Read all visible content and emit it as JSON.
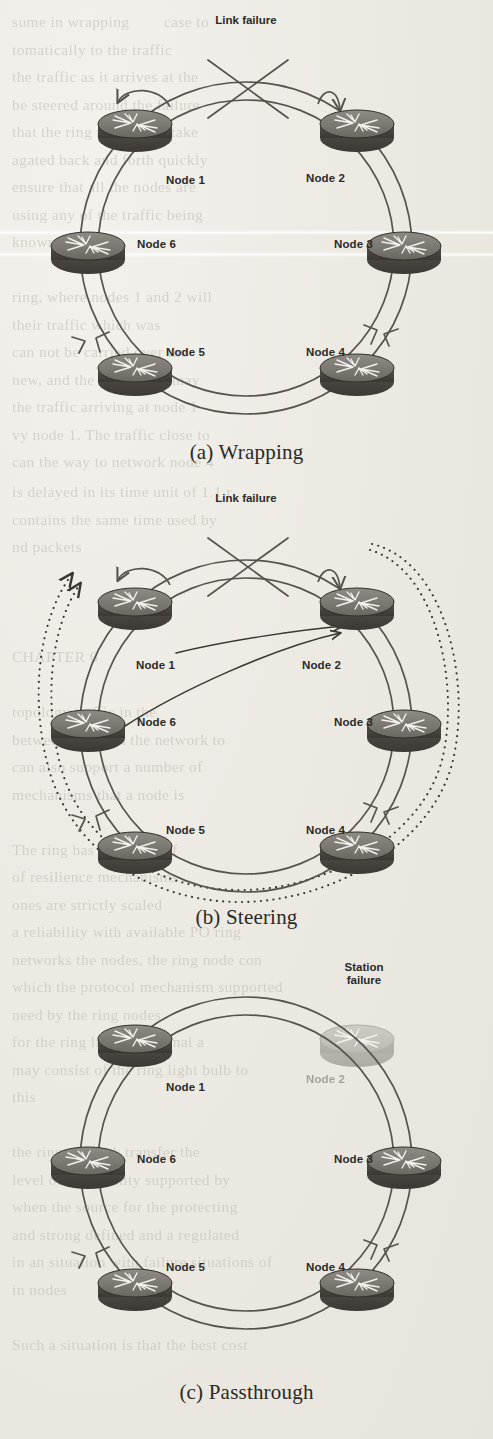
{
  "figure": {
    "type": "resilient-ring-network-protection-diagram",
    "page_background": "#eceae4",
    "ink_color": "#2c2a26",
    "node_body_color": "#4a4741",
    "node_top_color": "#7b7872",
    "node_faded_color": "#b9b6b0",
    "panels": [
      {
        "id": "a",
        "caption": "(a) Wrapping",
        "failure_label": "Link failure",
        "failure_type": "link",
        "failure_between": [
          "Node 1",
          "Node 2"
        ],
        "nodes": [
          {
            "label": "Node 1",
            "angle_deg": 120
          },
          {
            "label": "Node 2",
            "angle_deg": 60
          },
          {
            "label": "Node 3",
            "angle_deg": 0
          },
          {
            "label": "Node 4",
            "angle_deg": 300
          },
          {
            "label": "Node 5",
            "angle_deg": 240
          },
          {
            "label": "Node 6",
            "angle_deg": 180
          }
        ],
        "ringlets": 2,
        "wrap_loops": [
          "Node 1",
          "Node 2"
        ],
        "dotted_bypass": false
      },
      {
        "id": "b",
        "caption": "(b) Steering",
        "failure_label": "Link failure",
        "failure_type": "link",
        "failure_between": [
          "Node 1",
          "Node 2"
        ],
        "nodes": [
          {
            "label": "Node 1",
            "angle_deg": 120
          },
          {
            "label": "Node 2",
            "angle_deg": 60
          },
          {
            "label": "Node 3",
            "angle_deg": 0
          },
          {
            "label": "Node 4",
            "angle_deg": 300
          },
          {
            "label": "Node 5",
            "angle_deg": 240
          },
          {
            "label": "Node 6",
            "angle_deg": 180
          }
        ],
        "ringlets": 2,
        "wrap_loops": [
          "Node 1",
          "Node 2"
        ],
        "chord_arrows": [
          {
            "from": "Node 1",
            "to": "Node 2"
          },
          {
            "from": "Node 6",
            "to": "Node 2"
          }
        ],
        "dotted_bypass": true,
        "dotted_bypass_count": 2,
        "dotted_bypass_to": "Node 2"
      },
      {
        "id": "c",
        "caption": "(c) Passthrough",
        "failure_label": "Station\nfailure",
        "failure_type": "station",
        "failed_node": "Node 2",
        "nodes": [
          {
            "label": "Node 1",
            "angle_deg": 120
          },
          {
            "label": "Node 2",
            "angle_deg": 60
          },
          {
            "label": "Node 3",
            "angle_deg": 0
          },
          {
            "label": "Node 4",
            "angle_deg": 300
          },
          {
            "label": "Node 5",
            "angle_deg": 240
          },
          {
            "label": "Node 6",
            "angle_deg": 180
          }
        ],
        "ringlets": 2,
        "wrap_loops": [],
        "dotted_bypass": false
      }
    ]
  },
  "ghost_text": {
    "block1": "sume in wrapping        case to\ntomatically to the traffic\nthe traffic as it arrives at the\nbe steered around the failure\nthat the ring nodes may take\nagated back and forth quickly\nensure that all the nodes are\nusing any of the traffic being\nknown as\n\nring, where nodes 1 and 2 will\ntheir traffic which was\ncan not be carried over the\nnew, and the ring nodes may\nthe traffic arriving at node 1\nvy node 1. The traffic close to\ncan the way to network node 4",
    "block2": "is delayed in its time unit of 1.1 r\ncontains the same time used by\nnd packets\n\n\n\nCHAPTER 6\n\ntopology traffic in the\nbetween nodes in the network to\ncan also support a number of\nmechanisms that a node is\n\nThe ring has a number of\nof resilience mechanisms\nones are strictly scaled\na reliability with available PO ring\nnetworks the nodes, the ring node con\nwhich the protocol mechanism supported\nneed by the ring nodes\nfor the ring light and signal a\nmay consist of the ring light bulb to\nthis\n\nthe ring network transfer the\nlevel of availability supported by\nwhen the source for the protecting\nand strong defined and a regulated\nin an situation with failure situations of\nin nodes\n\nSuch a situation is that the best cost"
  }
}
